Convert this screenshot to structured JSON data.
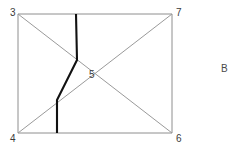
{
  "figure": {
    "side_label": "B",
    "side_label_position": {
      "x": 221,
      "y": 64
    },
    "background_color": "#ffffff",
    "frame_color": "#8e8e8e",
    "diagonal_color": "#9a9a9a",
    "path_color": "#111111"
  },
  "nodes": [
    {
      "id": "n3",
      "label": "3",
      "x": 18,
      "y": 14,
      "label_x": 10,
      "label_y": 12
    },
    {
      "id": "n7",
      "label": "7",
      "x": 172,
      "y": 14,
      "label_x": 176,
      "label_y": 12
    },
    {
      "id": "n4",
      "label": "4",
      "x": 18,
      "y": 133,
      "label_x": 10,
      "label_y": 138
    },
    {
      "id": "n6",
      "label": "6",
      "x": 172,
      "y": 133,
      "label_x": 176,
      "label_y": 138
    },
    {
      "id": "n5",
      "label": "5",
      "x": 96,
      "y": 73,
      "label_x": 89,
      "label_y": 74
    }
  ],
  "frame_edges": [
    {
      "name": "top-edge",
      "from": "n3",
      "to": "n7",
      "x1": 18,
      "y1": 14,
      "x2": 172,
      "y2": 14
    },
    {
      "name": "left-edge",
      "from": "n3",
      "to": "n4",
      "x1": 18,
      "y1": 14,
      "x2": 18,
      "y2": 133
    },
    {
      "name": "right-edge",
      "from": "n7",
      "to": "n6",
      "x1": 172,
      "y1": 14,
      "x2": 172,
      "y2": 133
    },
    {
      "name": "bottom-edge",
      "from": "n4",
      "to": "n6",
      "x1": 18,
      "y1": 133,
      "x2": 172,
      "y2": 133
    }
  ],
  "diagonals": [
    {
      "name": "diagonal-3-6",
      "from": "n3",
      "to": "n6",
      "x1": 18,
      "y1": 14,
      "x2": 172,
      "y2": 133
    },
    {
      "name": "diagonal-4-7",
      "from": "n4",
      "to": "n7",
      "x1": 18,
      "y1": 133,
      "x2": 172,
      "y2": 14
    }
  ],
  "polyline_path": {
    "name": "thick-polyline",
    "points": "76,14 77,60 57,100 57,133",
    "vertices": [
      {
        "x": 76,
        "y": 14
      },
      {
        "x": 77,
        "y": 60
      },
      {
        "x": 57,
        "y": 100
      },
      {
        "x": 57,
        "y": 133
      }
    ],
    "stroke_width": 2.1
  }
}
